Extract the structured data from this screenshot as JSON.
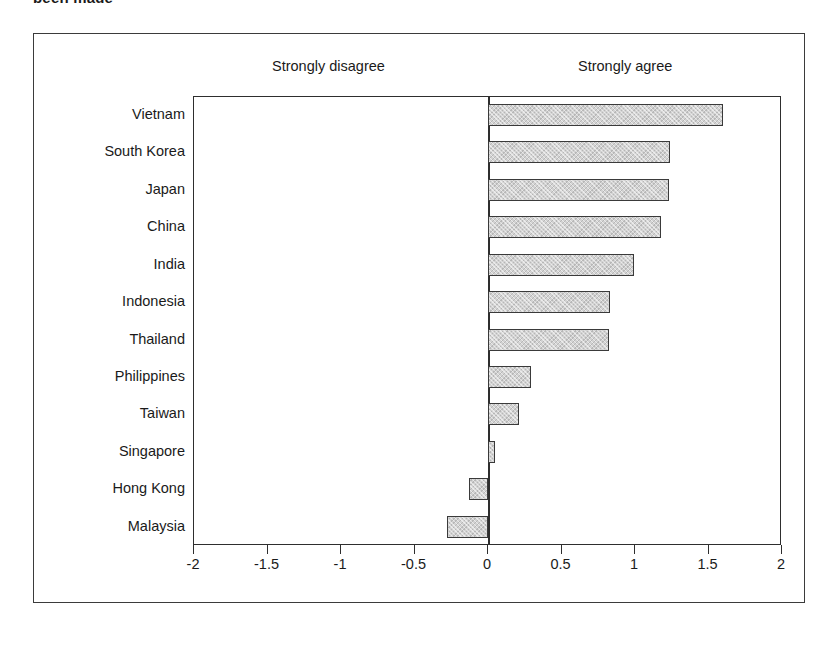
{
  "caption_fragment": "been made",
  "header": {
    "left_pole_label": "Strongly disagree",
    "right_pole_label": "Strongly agree"
  },
  "axis": {
    "tick_labels": [
      "-2",
      "-1.5",
      "-1",
      "-0.5",
      "0",
      "0.5",
      "1",
      "1.5",
      "2"
    ],
    "tick_values": [
      -2,
      -1.5,
      -1,
      -0.5,
      0,
      0.5,
      1,
      1.5,
      2
    ]
  },
  "colors": {
    "bar_fill": "#d2d2d2",
    "bar_border": "#3a3a3a",
    "frame": "#3b3b3b",
    "axis": "#2e2e2e",
    "text": "#1a1a1a",
    "background": "#ffffff"
  },
  "chart_data": {
    "type": "bar",
    "orientation": "horizontal",
    "title": "",
    "subtitle": "",
    "xlabel": "",
    "ylabel": "",
    "xlim": [
      -2,
      2
    ],
    "grid": false,
    "legend": "none",
    "zero_baseline": 0,
    "annotations": [
      "Strongly disagree",
      "Strongly agree"
    ],
    "categories": [
      "Vietnam",
      "South Korea",
      "Japan",
      "China",
      "India",
      "Indonesia",
      "Thailand",
      "Philippines",
      "Taiwan",
      "Singapore",
      "Hong Kong",
      "Malaysia"
    ],
    "values": [
      1.6,
      1.24,
      1.23,
      1.18,
      0.99,
      0.83,
      0.82,
      0.29,
      0.21,
      0.05,
      -0.13,
      -0.28
    ],
    "xticks": [
      -2,
      -1.5,
      -1,
      -0.5,
      0,
      0.5,
      1,
      1.5,
      2
    ],
    "xticklabels": [
      "-2",
      "-1.5",
      "-1",
      "-0.5",
      "0",
      "0.5",
      "1",
      "1.5",
      "2"
    ]
  }
}
